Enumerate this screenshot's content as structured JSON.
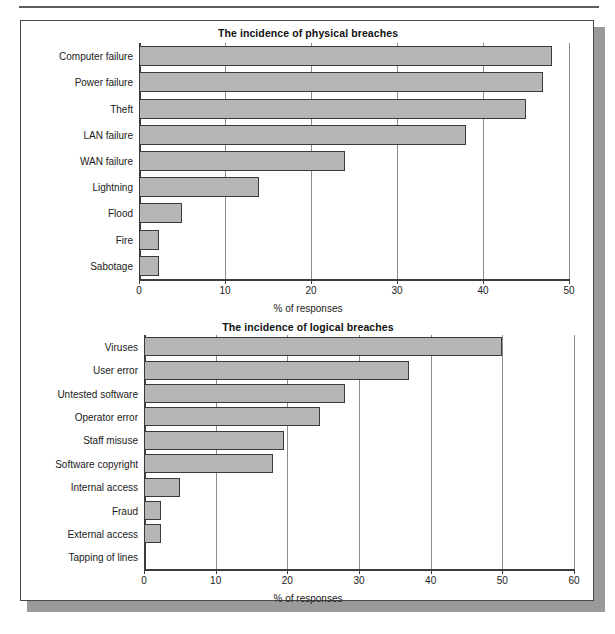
{
  "figure": {
    "background_color": "#ffffff",
    "frame_border_color": "#4b4b4b",
    "shadow_color": "#9a9a9a",
    "bar_fill_color": "#b6b6b6",
    "bar_border_color": "#3a3a3a",
    "gridline_color": "#8d8d8d"
  },
  "chart_data": [
    {
      "type": "bar",
      "orientation": "horizontal",
      "title": "The incidence of physical breaches",
      "xlabel": "% of responses",
      "ylabel": "",
      "xlim": [
        0,
        50
      ],
      "xticks": [
        0,
        10,
        20,
        30,
        40,
        50
      ],
      "xtick_labels": [
        "0",
        "10",
        "20",
        "30",
        "40",
        "50"
      ],
      "grid": true,
      "legend": false,
      "categories": [
        "Computer failure",
        "Power failure",
        "Theft",
        "LAN failure",
        "WAN failure",
        "Lightning",
        "Flood",
        "Fire",
        "Sabotage"
      ],
      "values": [
        48,
        47,
        45,
        38,
        24,
        14,
        5,
        2.3,
        2.3
      ]
    },
    {
      "type": "bar",
      "orientation": "horizontal",
      "title": "The incidence of logical breaches",
      "xlabel": "% of responses",
      "ylabel": "",
      "xlim": [
        0,
        60
      ],
      "xticks": [
        0,
        10,
        20,
        30,
        40,
        50,
        60
      ],
      "xtick_labels": [
        "0",
        "10",
        "20",
        "30",
        "40",
        "50",
        "60"
      ],
      "grid": true,
      "legend": false,
      "categories": [
        "Viruses",
        "User error",
        "Untested software",
        "Operator error",
        "Staff misuse",
        "Software copyright",
        "Internal access",
        "Fraud",
        "External access",
        "Tapping of lines"
      ],
      "values": [
        50,
        37,
        28,
        24.5,
        19.5,
        18,
        5,
        2.4,
        2.4,
        0
      ]
    }
  ]
}
